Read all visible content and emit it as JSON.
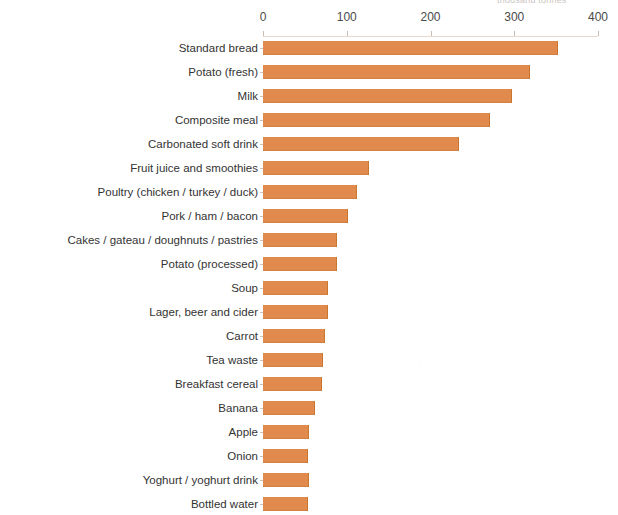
{
  "chart_data": {
    "type": "bar",
    "orientation": "horizontal",
    "title": "",
    "xlabel": "thousand tonnes",
    "ylabel": "",
    "xlim": [
      0,
      400
    ],
    "xticks": [
      0,
      100,
      200,
      300,
      400
    ],
    "xtick_labels": [
      "0",
      "100",
      "200",
      "300",
      "400"
    ],
    "axis_position": "top",
    "grid": false,
    "legend": false,
    "bar_color": "#e08a4e",
    "categories": [
      "Standard bread",
      "Potato (fresh)",
      "Milk",
      "Composite meal",
      "Carbonated soft drink",
      "Fruit juice and smoothies",
      "Poultry (chicken / turkey / duck)",
      "Pork / ham / bacon",
      "Cakes / gateau / doughnuts / pastries",
      "Potato (processed)",
      "Soup",
      "Lager, beer and cider",
      "Carrot",
      "Tea waste",
      "Breakfast cereal",
      "Banana",
      "Apple",
      "Onion",
      "Yoghurt / yoghurt drink",
      "Bottled water"
    ],
    "values": [
      351,
      318,
      296,
      270,
      233,
      125,
      111,
      100,
      87,
      87,
      77,
      76,
      73,
      70,
      69,
      61,
      54,
      53,
      54,
      52
    ]
  }
}
